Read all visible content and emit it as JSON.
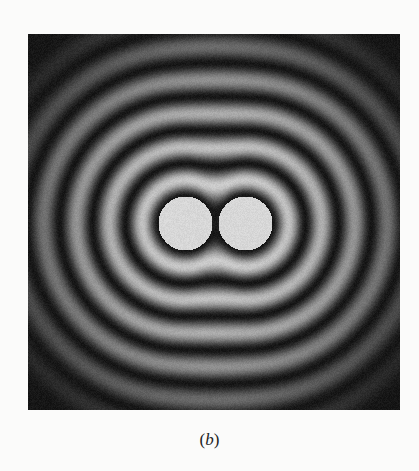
{
  "figure": {
    "caption_open": "(",
    "caption_label": "b",
    "caption_close": ")",
    "panel": {
      "background": "#111111",
      "width": 372,
      "height": 376
    },
    "pattern": {
      "sources": [
        {
          "cx": 157,
          "cy": 189,
          "r": 30
        },
        {
          "cx": 217,
          "cy": 189,
          "r": 30
        }
      ],
      "disc_color": "#d9d9d9",
      "ring_color": "#bdbdbd",
      "dark_color": "#141414",
      "ring_period": 33,
      "fade_radius": 205
    }
  }
}
